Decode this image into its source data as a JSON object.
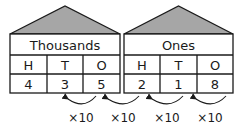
{
  "houses": [
    {
      "title": "Thousands",
      "columns": [
        "H",
        "T",
        "O"
      ],
      "digits": [
        "4",
        "3",
        "5"
      ]
    },
    {
      "title": "Ones",
      "columns": [
        "H",
        "T",
        "O"
      ],
      "digits": [
        "2",
        "1",
        "8"
      ]
    }
  ],
  "arrows": [
    {
      "label": "×10"
    },
    {
      "label": "×10"
    },
    {
      "label": "×10"
    },
    {
      "label": "×10"
    }
  ],
  "colors": {
    "roof": "#a6a6a6",
    "line": "#1a1a1a"
  }
}
